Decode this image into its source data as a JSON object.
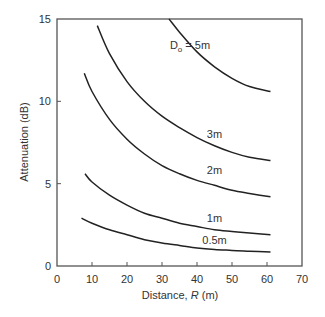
{
  "chart_data": {
    "type": "line",
    "title": "",
    "xlabel": "Distance, R (m)",
    "xlabel_parts": {
      "prefix": "Distance, ",
      "italic": "R",
      "suffix": " (m)"
    },
    "ylabel": "Attenuation (dB)",
    "xlim": [
      0,
      70
    ],
    "ylim": [
      0,
      15
    ],
    "xticks": [
      0,
      10,
      20,
      30,
      40,
      50,
      60,
      70
    ],
    "yticks": [
      0,
      5,
      10,
      15
    ],
    "grid": false,
    "legend": "inline labels",
    "series": [
      {
        "name": "Do = 5m",
        "label_main": "D",
        "label_sub": "o",
        "label_rest": " = 5m",
        "label_pos": [
          38,
          13.2
        ],
        "x": [
          32,
          35,
          40,
          45,
          50,
          55,
          61
        ],
        "y": [
          15.0,
          14.2,
          13.0,
          12.1,
          11.4,
          10.9,
          10.6
        ]
      },
      {
        "name": "3m",
        "label_pos": [
          45,
          7.8
        ],
        "x": [
          11.5,
          15,
          20,
          25,
          30,
          35,
          40,
          45,
          50,
          55,
          61
        ],
        "y": [
          14.6,
          12.9,
          11.2,
          10.0,
          9.1,
          8.4,
          7.8,
          7.3,
          6.9,
          6.6,
          6.4
        ]
      },
      {
        "name": "2m",
        "label_pos": [
          45,
          5.6
        ],
        "x": [
          7.8,
          10,
          15,
          20,
          25,
          30,
          35,
          40,
          45,
          50,
          55,
          61
        ],
        "y": [
          11.7,
          10.6,
          8.9,
          7.7,
          6.8,
          6.1,
          5.6,
          5.2,
          4.9,
          4.6,
          4.4,
          4.2
        ]
      },
      {
        "name": "1m",
        "label_pos": [
          45,
          2.7
        ],
        "x": [
          8,
          10,
          15,
          20,
          25,
          30,
          35,
          40,
          45,
          50,
          55,
          61
        ],
        "y": [
          5.6,
          5.1,
          4.3,
          3.7,
          3.2,
          2.9,
          2.6,
          2.4,
          2.2,
          2.1,
          2.0,
          1.9
        ]
      },
      {
        "name": "0.5m",
        "label_pos": [
          45,
          1.35
        ],
        "x": [
          7,
          10,
          15,
          20,
          25,
          30,
          35,
          40,
          45,
          50,
          55,
          61
        ],
        "y": [
          2.9,
          2.6,
          2.2,
          1.9,
          1.6,
          1.4,
          1.25,
          1.1,
          1.0,
          0.95,
          0.9,
          0.85
        ]
      }
    ]
  },
  "style": {
    "axis_color": "#555555",
    "line_color": "#222222",
    "text_color": "#333333"
  }
}
